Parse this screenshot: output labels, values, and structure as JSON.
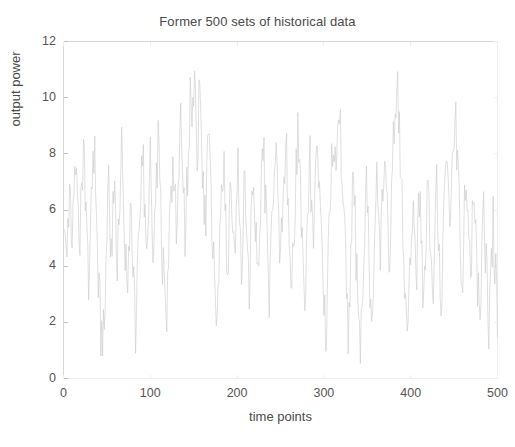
{
  "chart_data": {
    "type": "line",
    "title": "Former 500 sets of historical data",
    "xlabel": "time points",
    "ylabel": "output power",
    "xlim": [
      0,
      500
    ],
    "ylim": [
      0,
      12
    ],
    "xticks": [
      0,
      100,
      200,
      300,
      400,
      500
    ],
    "yticks": [
      0,
      2,
      4,
      6,
      8,
      10,
      12
    ],
    "xtick_labels": [
      "0",
      "100",
      "200",
      "300",
      "400",
      "500"
    ],
    "ytick_labels": [
      "0",
      "2",
      "4",
      "6",
      "8",
      "10",
      "12"
    ],
    "grid": false,
    "legend": null,
    "series": [
      {
        "name": "output power",
        "color": "#c9c9c9",
        "line_width": 0.6,
        "x_start": 1,
        "x_step": 1,
        "n_points": 500,
        "y_min": 0.5,
        "y_max": 11.0,
        "y_mean": 5.6,
        "values": [
          5.9,
          6.2,
          5.4,
          4.8,
          5.6,
          6.4,
          7.1,
          6.3,
          5.5,
          4.9,
          5.2,
          6.0,
          6.8,
          7.4,
          6.6,
          5.8,
          5.1,
          4.4,
          5.0,
          5.7,
          6.5,
          7.2,
          8.1,
          7.3,
          6.4,
          5.6,
          4.7,
          4.0,
          3.3,
          4.1,
          5.0,
          5.9,
          6.7,
          7.6,
          8.4,
          7.5,
          6.6,
          5.7,
          4.8,
          4.0,
          3.2,
          2.5,
          1.8,
          1.1,
          0.8,
          1.6,
          2.5,
          3.4,
          4.3,
          5.2,
          6.1,
          6.9,
          6.1,
          5.3,
          4.5,
          5.3,
          6.2,
          7.0,
          6.2,
          5.4,
          4.6,
          3.8,
          4.6,
          5.5,
          6.3,
          7.1,
          7.9,
          7.0,
          6.2,
          5.4,
          4.6,
          3.8,
          3.0,
          3.8,
          4.7,
          5.6,
          6.4,
          5.6,
          4.8,
          4.0,
          3.2,
          2.4,
          1.6,
          2.4,
          3.3,
          4.2,
          5.1,
          6.0,
          6.8,
          7.6,
          8.4,
          7.6,
          6.7,
          5.9,
          5.1,
          4.3,
          5.1,
          6.0,
          6.8,
          7.6,
          6.8,
          6.0,
          5.2,
          4.4,
          5.2,
          6.1,
          6.9,
          7.7,
          8.5,
          7.7,
          6.9,
          6.1,
          5.3,
          4.5,
          3.7,
          2.9,
          2.1,
          1.4,
          2.2,
          3.1,
          4.0,
          4.9,
          5.8,
          6.6,
          7.4,
          8.2,
          7.4,
          6.6,
          5.8,
          5.0,
          5.8,
          6.7,
          7.5,
          8.3,
          9.1,
          8.3,
          7.5,
          6.7,
          5.9,
          5.1,
          5.9,
          6.8,
          7.6,
          8.4,
          9.2,
          10.0,
          9.2,
          8.4,
          9.2,
          10.1,
          10.6,
          9.8,
          9.0,
          8.2,
          8.9,
          9.7,
          10.2,
          9.4,
          8.6,
          7.8,
          7.0,
          6.2,
          5.4,
          6.2,
          7.1,
          7.9,
          8.7,
          7.9,
          7.1,
          6.3,
          5.5,
          4.7,
          3.9,
          3.1,
          2.3,
          1.5,
          1.8,
          2.7,
          3.6,
          4.5,
          5.4,
          6.2,
          7.0,
          7.8,
          7.0,
          6.2,
          5.4,
          4.6,
          3.8,
          4.6,
          5.5,
          6.3,
          7.1,
          6.3,
          5.5,
          4.7,
          3.9,
          4.7,
          5.6,
          6.4,
          7.2,
          6.4,
          5.6,
          4.8,
          4.0,
          4.8,
          5.7,
          6.5,
          7.3,
          6.5,
          5.7,
          4.9,
          4.1,
          3.3,
          4.1,
          5.0,
          5.9,
          6.7,
          7.5,
          6.7,
          5.9,
          5.1,
          4.3,
          3.5,
          4.3,
          5.2,
          6.1,
          6.9,
          7.7,
          8.5,
          7.7,
          6.9,
          6.1,
          5.3,
          4.5,
          3.7,
          2.9,
          3.7,
          4.6,
          5.5,
          6.3,
          7.1,
          7.9,
          8.7,
          7.9,
          7.1,
          6.3,
          5.5,
          4.7,
          3.9,
          4.7,
          5.6,
          6.4,
          7.2,
          8.0,
          8.8,
          8.0,
          7.2,
          6.4,
          5.6,
          4.8,
          4.0,
          3.2,
          4.0,
          4.9,
          5.8,
          6.6,
          7.4,
          8.2,
          9.0,
          8.2,
          7.4,
          6.6,
          5.8,
          5.0,
          4.2,
          3.4,
          2.6,
          3.4,
          4.3,
          5.2,
          6.1,
          6.9,
          7.7,
          6.9,
          6.1,
          5.3,
          4.5,
          5.3,
          6.2,
          7.0,
          7.8,
          8.6,
          7.8,
          7.0,
          6.2,
          5.4,
          4.6,
          3.8,
          3.0,
          2.2,
          1.4,
          2.2,
          3.1,
          4.0,
          4.9,
          5.8,
          6.6,
          7.4,
          8.2,
          9.0,
          8.2,
          7.4,
          6.6,
          7.4,
          8.3,
          9.1,
          9.9,
          9.1,
          8.3,
          7.5,
          6.7,
          5.9,
          5.1,
          4.3,
          3.5,
          2.7,
          1.9,
          2.7,
          3.6,
          4.5,
          5.4,
          6.2,
          7.0,
          6.2,
          5.4,
          4.6,
          3.8,
          3.0,
          2.2,
          1.4,
          0.7,
          1.5,
          2.4,
          3.3,
          4.2,
          5.1,
          6.0,
          6.8,
          6.0,
          5.2,
          4.4,
          3.6,
          2.8,
          2.0,
          2.8,
          3.7,
          4.6,
          5.5,
          6.3,
          7.1,
          6.3,
          5.5,
          4.7,
          3.9,
          4.7,
          5.6,
          6.4,
          7.2,
          8.0,
          7.2,
          6.4,
          5.6,
          4.8,
          4.0,
          4.8,
          5.7,
          6.5,
          7.3,
          8.1,
          8.9,
          9.7,
          10.3,
          10.8,
          10.0,
          9.2,
          8.4,
          7.6,
          6.8,
          6.0,
          5.2,
          4.4,
          3.6,
          2.8,
          2.0,
          1.2,
          1.9,
          2.8,
          3.7,
          4.6,
          5.5,
          6.3,
          5.5,
          4.7,
          3.9,
          3.1,
          3.9,
          4.8,
          5.7,
          6.5,
          5.7,
          4.9,
          4.1,
          3.3,
          2.5,
          3.3,
          4.2,
          5.1,
          6.0,
          6.8,
          6.0,
          5.2,
          4.4,
          3.6,
          2.8,
          3.6,
          4.5,
          5.4,
          6.2,
          7.0,
          6.2,
          5.4,
          4.6,
          3.8,
          3.0,
          3.8,
          4.7,
          5.6,
          6.4,
          7.2,
          8.0,
          7.2,
          6.4,
          5.6,
          4.8,
          5.6,
          6.5,
          7.3,
          8.1,
          8.9,
          9.7,
          8.9,
          8.1,
          7.3,
          6.5,
          5.7,
          4.9,
          4.1,
          3.3,
          4.1,
          5.0,
          5.9,
          6.7,
          7.5,
          6.7,
          5.9,
          5.1,
          4.3,
          3.5,
          4.3,
          5.2,
          6.0,
          6.8,
          6.0,
          5.2,
          4.4,
          3.6,
          2.8,
          2.0,
          2.8,
          3.7,
          4.6,
          5.5,
          6.3,
          5.5,
          4.7,
          3.9,
          3.1,
          2.3,
          1.5,
          2.3,
          3.2,
          4.1,
          5.0,
          5.8,
          5.0,
          4.2,
          3.4,
          2.6,
          1.8
        ]
      }
    ]
  },
  "axes": {
    "frame_color": "#d6d6d6",
    "tick_color": "#c0c0c0",
    "label_color": "#4a4a4a"
  },
  "background": "#ffffff"
}
